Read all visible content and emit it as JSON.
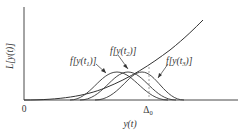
{
  "diagram": {
    "y_axis_label": "L[y(t)]",
    "x_axis_label": "y(t)",
    "origin_label": "0",
    "threshold_label": "Δ0",
    "curves": [
      {
        "name": "loss-curve",
        "label": "L[y(t)]"
      },
      {
        "name": "density-t1",
        "label": "f[y(t1)]",
        "peak_x": 117
      },
      {
        "name": "density-t2",
        "label": "f[y(t2)]",
        "peak_x": 128
      },
      {
        "name": "density-t3",
        "label": "f[y(t3)]",
        "peak_x": 142
      }
    ],
    "annotations": {
      "f1": {
        "pre": "f[y(t",
        "sub": "1",
        "post": ")]"
      },
      "f2": {
        "pre": "f[y(t",
        "sub": "2",
        "post": ")]"
      },
      "f3": {
        "pre": "f[y(t",
        "sub": "3",
        "post": ")]"
      }
    },
    "dashed_line_at": "Δ0",
    "colors": {
      "line": "#333333",
      "dashed": "#888888",
      "background": "#ffffff"
    }
  }
}
